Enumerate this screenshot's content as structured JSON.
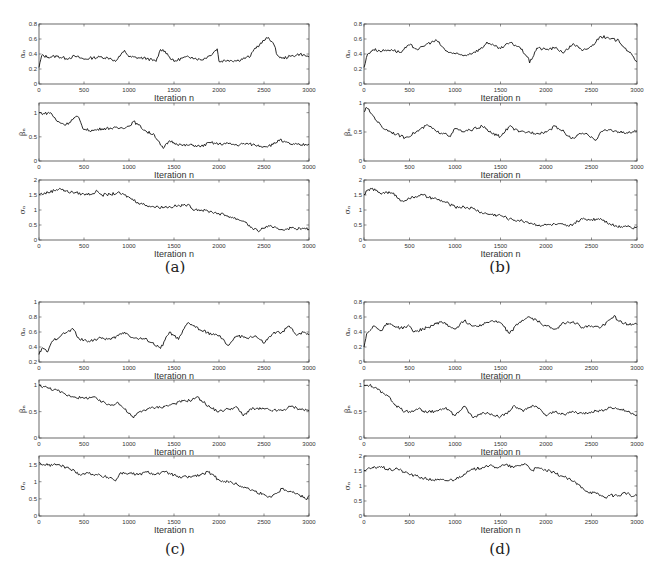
{
  "figure": {
    "panels": [
      {
        "id": "a",
        "caption": "(a)"
      },
      {
        "id": "b",
        "caption": "(b)"
      },
      {
        "id": "c",
        "caption": "(c)"
      },
      {
        "id": "d",
        "caption": "(d)"
      }
    ]
  },
  "chart_data": [
    {
      "panel": "a",
      "subplot": 1,
      "type": "line",
      "xlabel": "Iteration n",
      "ylabel": "α_n",
      "xlim": [
        0,
        3000
      ],
      "ylim": [
        0,
        0.8
      ],
      "xticks": [
        0,
        500,
        1000,
        1500,
        2000,
        2500,
        3000
      ],
      "yticks": [
        0,
        0.2,
        0.4,
        0.6,
        0.8
      ],
      "x": [
        0,
        30,
        100,
        200,
        300,
        400,
        500,
        600,
        700,
        800,
        850,
        900,
        950,
        1000,
        1100,
        1200,
        1300,
        1350,
        1400,
        1450,
        1500,
        1600,
        1700,
        1800,
        1900,
        1980,
        2000,
        2100,
        2200,
        2300,
        2350,
        2400,
        2450,
        2500,
        2550,
        2600,
        2650,
        2700,
        2800,
        2900,
        3000
      ],
      "values": [
        0.22,
        0.38,
        0.36,
        0.37,
        0.34,
        0.37,
        0.33,
        0.35,
        0.36,
        0.34,
        0.3,
        0.37,
        0.45,
        0.36,
        0.35,
        0.34,
        0.3,
        0.46,
        0.44,
        0.36,
        0.3,
        0.35,
        0.36,
        0.32,
        0.38,
        0.47,
        0.3,
        0.32,
        0.31,
        0.35,
        0.37,
        0.48,
        0.52,
        0.58,
        0.62,
        0.55,
        0.38,
        0.34,
        0.37,
        0.4,
        0.36
      ]
    },
    {
      "panel": "a",
      "subplot": 2,
      "type": "line",
      "xlabel": "Iteration n",
      "ylabel": "β_n",
      "xlim": [
        0,
        3000
      ],
      "ylim": [
        0,
        1.2
      ],
      "xticks": [
        0,
        500,
        1000,
        1500,
        2000,
        2500,
        3000
      ],
      "yticks": [
        0,
        0.5,
        1
      ],
      "x": [
        0,
        50,
        130,
        200,
        300,
        400,
        430,
        500,
        600,
        700,
        800,
        900,
        1000,
        1050,
        1100,
        1200,
        1280,
        1350,
        1380,
        1450,
        1500,
        1600,
        1700,
        1800,
        1900,
        2000,
        2100,
        2200,
        2300,
        2400,
        2500,
        2600,
        2680,
        2700,
        2800,
        2900,
        3000
      ],
      "values": [
        1.0,
        0.98,
        1.0,
        0.82,
        0.75,
        0.9,
        0.92,
        0.65,
        0.63,
        0.67,
        0.68,
        0.68,
        0.72,
        0.82,
        0.75,
        0.6,
        0.55,
        0.33,
        0.26,
        0.42,
        0.38,
        0.32,
        0.33,
        0.3,
        0.38,
        0.35,
        0.36,
        0.33,
        0.36,
        0.33,
        0.3,
        0.34,
        0.45,
        0.4,
        0.35,
        0.33,
        0.35
      ]
    },
    {
      "panel": "a",
      "subplot": 3,
      "type": "line",
      "xlabel": "Iteration n",
      "ylabel": "σ_n",
      "xlim": [
        0,
        3000
      ],
      "ylim": [
        0,
        2
      ],
      "xticks": [
        0,
        500,
        1000,
        1500,
        2000,
        2500,
        3000
      ],
      "yticks": [
        0,
        0.5,
        1,
        1.5,
        2
      ],
      "x": [
        0,
        100,
        230,
        300,
        400,
        500,
        600,
        650,
        700,
        800,
        870,
        950,
        1000,
        1100,
        1200,
        1300,
        1400,
        1500,
        1600,
        1650,
        1700,
        1800,
        1900,
        2000,
        2100,
        2200,
        2300,
        2350,
        2430,
        2500,
        2550,
        2600,
        2700,
        2800,
        2900,
        3000
      ],
      "values": [
        1.52,
        1.58,
        1.72,
        1.62,
        1.58,
        1.52,
        1.55,
        1.63,
        1.5,
        1.52,
        1.57,
        1.5,
        1.42,
        1.25,
        1.15,
        1.1,
        1.1,
        1.12,
        1.15,
        1.18,
        1.05,
        1.0,
        0.95,
        0.88,
        0.8,
        0.7,
        0.6,
        0.42,
        0.3,
        0.4,
        0.48,
        0.4,
        0.35,
        0.4,
        0.38,
        0.36
      ]
    },
    {
      "panel": "b",
      "subplot": 1,
      "type": "line",
      "xlabel": "Iteration n",
      "ylabel": "α_n",
      "xlim": [
        0,
        3000
      ],
      "ylim": [
        0,
        0.8
      ],
      "xticks": [
        0,
        500,
        1000,
        1500,
        2000,
        2500,
        3000
      ],
      "yticks": [
        0,
        0.2,
        0.4,
        0.6,
        0.8
      ],
      "x": [
        0,
        40,
        100,
        200,
        300,
        400,
        500,
        600,
        700,
        800,
        900,
        1000,
        1100,
        1200,
        1300,
        1350,
        1400,
        1500,
        1600,
        1700,
        1800,
        1820,
        1900,
        2000,
        2100,
        2200,
        2300,
        2400,
        2500,
        2600,
        2700,
        2800,
        2900,
        3000
      ],
      "values": [
        0.22,
        0.4,
        0.46,
        0.44,
        0.46,
        0.42,
        0.52,
        0.46,
        0.54,
        0.58,
        0.44,
        0.4,
        0.38,
        0.42,
        0.48,
        0.56,
        0.52,
        0.47,
        0.55,
        0.5,
        0.36,
        0.28,
        0.48,
        0.46,
        0.48,
        0.42,
        0.54,
        0.44,
        0.5,
        0.64,
        0.6,
        0.58,
        0.44,
        0.3
      ]
    },
    {
      "panel": "b",
      "subplot": 2,
      "type": "line",
      "xlabel": "Iteration n",
      "ylabel": "β_n",
      "xlim": [
        0,
        3000
      ],
      "ylim": [
        0,
        1
      ],
      "xticks": [
        0,
        500,
        1000,
        1500,
        2000,
        2500,
        3000
      ],
      "yticks": [
        0,
        0.5,
        1
      ],
      "x": [
        0,
        30,
        100,
        200,
        300,
        450,
        550,
        700,
        800,
        900,
        950,
        1000,
        1100,
        1200,
        1300,
        1400,
        1500,
        1600,
        1700,
        1800,
        1900,
        2000,
        2100,
        2200,
        2280,
        2400,
        2500,
        2550,
        2600,
        2700,
        2800,
        2900,
        3000
      ],
      "values": [
        0.85,
        0.92,
        0.78,
        0.58,
        0.5,
        0.4,
        0.48,
        0.62,
        0.5,
        0.48,
        0.42,
        0.56,
        0.5,
        0.55,
        0.6,
        0.48,
        0.42,
        0.6,
        0.5,
        0.5,
        0.48,
        0.5,
        0.6,
        0.5,
        0.38,
        0.48,
        0.42,
        0.36,
        0.5,
        0.54,
        0.5,
        0.48,
        0.52
      ]
    },
    {
      "panel": "b",
      "subplot": 3,
      "type": "line",
      "xlabel": "Iteration n",
      "ylabel": "σ_n",
      "xlim": [
        0,
        3000
      ],
      "ylim": [
        0,
        2
      ],
      "xticks": [
        0,
        500,
        1000,
        1500,
        2000,
        2500,
        3000
      ],
      "yticks": [
        0,
        0.5,
        1,
        1.5,
        2
      ],
      "x": [
        0,
        70,
        200,
        250,
        350,
        400,
        500,
        600,
        650,
        700,
        800,
        900,
        1000,
        1100,
        1200,
        1300,
        1400,
        1500,
        1600,
        1700,
        1800,
        1900,
        2000,
        2100,
        2200,
        2250,
        2350,
        2400,
        2500,
        2600,
        2700,
        2780,
        2900,
        2950,
        3000
      ],
      "values": [
        1.52,
        1.72,
        1.55,
        1.6,
        1.5,
        1.3,
        1.38,
        1.48,
        1.5,
        1.42,
        1.36,
        1.25,
        1.1,
        1.1,
        1.05,
        0.9,
        0.85,
        0.82,
        0.7,
        0.65,
        0.6,
        0.5,
        0.5,
        0.52,
        0.5,
        0.45,
        0.62,
        0.7,
        0.68,
        0.72,
        0.55,
        0.45,
        0.48,
        0.38,
        0.45
      ]
    },
    {
      "panel": "c",
      "subplot": 1,
      "type": "line",
      "xlabel": "Iteration n",
      "ylabel": "α_n",
      "xlim": [
        0,
        3000
      ],
      "ylim": [
        0.2,
        1
      ],
      "xticks": [
        0,
        500,
        1000,
        1500,
        2000,
        2500,
        3000
      ],
      "yticks": [
        0.2,
        0.4,
        0.6,
        0.8,
        1
      ],
      "x": [
        0,
        30,
        100,
        150,
        250,
        380,
        450,
        550,
        700,
        800,
        950,
        1050,
        1200,
        1350,
        1450,
        1500,
        1550,
        1650,
        1700,
        1800,
        1950,
        2000,
        2100,
        2200,
        2300,
        2400,
        2500,
        2600,
        2700,
        2780,
        2850,
        2950,
        3000
      ],
      "values": [
        0.3,
        0.38,
        0.34,
        0.48,
        0.56,
        0.64,
        0.5,
        0.48,
        0.52,
        0.5,
        0.6,
        0.52,
        0.5,
        0.38,
        0.6,
        0.55,
        0.5,
        0.72,
        0.7,
        0.62,
        0.56,
        0.55,
        0.42,
        0.55,
        0.52,
        0.55,
        0.45,
        0.58,
        0.6,
        0.68,
        0.57,
        0.6,
        0.56
      ]
    },
    {
      "panel": "c",
      "subplot": 2,
      "type": "line",
      "xlabel": "Iteration n",
      "ylabel": "β_n",
      "xlim": [
        0,
        3000
      ],
      "ylim": [
        0,
        1.1
      ],
      "xticks": [
        0,
        500,
        1000,
        1500,
        2000,
        2500,
        3000
      ],
      "yticks": [
        0,
        0.5,
        1
      ],
      "x": [
        0,
        100,
        200,
        300,
        400,
        500,
        600,
        700,
        800,
        870,
        950,
        1050,
        1100,
        1200,
        1300,
        1400,
        1500,
        1600,
        1700,
        1750,
        1800,
        1900,
        2000,
        2100,
        2200,
        2270,
        2350,
        2500,
        2600,
        2700,
        2800,
        2900,
        3000
      ],
      "values": [
        1.0,
        0.95,
        0.9,
        0.82,
        0.78,
        0.75,
        0.78,
        0.68,
        0.62,
        0.68,
        0.55,
        0.38,
        0.48,
        0.55,
        0.58,
        0.6,
        0.65,
        0.7,
        0.72,
        0.78,
        0.72,
        0.58,
        0.5,
        0.55,
        0.58,
        0.42,
        0.55,
        0.55,
        0.52,
        0.52,
        0.6,
        0.55,
        0.52
      ]
    },
    {
      "panel": "c",
      "subplot": 3,
      "type": "line",
      "xlabel": "Iteration n",
      "ylabel": "σ_n",
      "xlim": [
        0,
        3000
      ],
      "ylim": [
        0,
        1.75
      ],
      "xticks": [
        0,
        500,
        1000,
        1500,
        2000,
        2500,
        3000
      ],
      "yticks": [
        0,
        0.5,
        1,
        1.5
      ],
      "x": [
        0,
        50,
        100,
        200,
        300,
        400,
        450,
        550,
        650,
        700,
        800,
        850,
        900,
        1000,
        1100,
        1200,
        1300,
        1400,
        1500,
        1550,
        1700,
        1800,
        1880,
        1950,
        2000,
        2100,
        2200,
        2300,
        2400,
        2500,
        2550,
        2650,
        2700,
        2800,
        2900,
        2980,
        3000
      ],
      "values": [
        1.55,
        1.5,
        1.48,
        1.5,
        1.42,
        1.3,
        1.22,
        1.25,
        1.2,
        1.15,
        1.12,
        1.02,
        1.25,
        1.25,
        1.2,
        1.28,
        1.22,
        1.28,
        1.2,
        1.12,
        1.15,
        1.2,
        1.28,
        1.15,
        1.05,
        1.0,
        0.92,
        0.82,
        0.72,
        0.62,
        0.55,
        0.68,
        0.8,
        0.72,
        0.6,
        0.5,
        0.6
      ]
    },
    {
      "panel": "d",
      "subplot": 1,
      "type": "line",
      "xlabel": "Iteration n",
      "ylabel": "α_n",
      "xlim": [
        0,
        3000
      ],
      "ylim": [
        0,
        0.8
      ],
      "xticks": [
        0,
        500,
        1000,
        1500,
        2000,
        2500,
        3000
      ],
      "yticks": [
        0,
        0.2,
        0.4,
        0.6,
        0.8
      ],
      "x": [
        0,
        30,
        100,
        200,
        250,
        400,
        500,
        550,
        700,
        850,
        900,
        1000,
        1100,
        1200,
        1300,
        1400,
        1500,
        1600,
        1700,
        1800,
        1900,
        2000,
        2100,
        2200,
        2300,
        2400,
        2500,
        2600,
        2700,
        2750,
        2800,
        2900,
        3000
      ],
      "values": [
        0.2,
        0.38,
        0.48,
        0.42,
        0.52,
        0.45,
        0.48,
        0.4,
        0.46,
        0.54,
        0.5,
        0.44,
        0.55,
        0.48,
        0.5,
        0.55,
        0.52,
        0.38,
        0.52,
        0.6,
        0.55,
        0.48,
        0.44,
        0.52,
        0.54,
        0.46,
        0.48,
        0.46,
        0.56,
        0.62,
        0.54,
        0.5,
        0.5
      ]
    },
    {
      "panel": "d",
      "subplot": 2,
      "type": "line",
      "xlabel": "Iteration n",
      "ylabel": "β_n",
      "xlim": [
        0,
        3000
      ],
      "ylim": [
        0,
        1.1
      ],
      "xticks": [
        0,
        500,
        1000,
        1500,
        2000,
        2500,
        3000
      ],
      "yticks": [
        0,
        0.5,
        1
      ],
      "x": [
        0,
        60,
        150,
        250,
        350,
        450,
        500,
        600,
        700,
        800,
        900,
        1000,
        1100,
        1200,
        1300,
        1400,
        1500,
        1600,
        1650,
        1750,
        1850,
        1950,
        2000,
        2100,
        2200,
        2300,
        2400,
        2500,
        2600,
        2700,
        2800,
        2900,
        3000
      ],
      "values": [
        1.0,
        1.0,
        0.92,
        0.82,
        0.62,
        0.5,
        0.5,
        0.56,
        0.48,
        0.52,
        0.58,
        0.42,
        0.6,
        0.38,
        0.48,
        0.46,
        0.4,
        0.5,
        0.62,
        0.5,
        0.62,
        0.52,
        0.42,
        0.5,
        0.45,
        0.5,
        0.46,
        0.5,
        0.52,
        0.58,
        0.55,
        0.5,
        0.44
      ]
    },
    {
      "panel": "d",
      "subplot": 3,
      "type": "line",
      "xlabel": "Iteration n",
      "ylabel": "σ_n",
      "xlim": [
        0,
        3000
      ],
      "ylim": [
        0,
        2
      ],
      "xticks": [
        0,
        500,
        1000,
        1500,
        2000,
        2500,
        3000
      ],
      "yticks": [
        0,
        0.5,
        1,
        1.5,
        2
      ],
      "x": [
        0,
        100,
        170,
        300,
        350,
        450,
        550,
        700,
        800,
        900,
        1000,
        1100,
        1200,
        1300,
        1350,
        1450,
        1550,
        1650,
        1770,
        1850,
        1900,
        2000,
        2100,
        2200,
        2300,
        2400,
        2450,
        2550,
        2650,
        2700,
        2800,
        2870,
        2950,
        3000
      ],
      "values": [
        1.52,
        1.6,
        1.65,
        1.52,
        1.6,
        1.45,
        1.35,
        1.22,
        1.2,
        1.18,
        1.22,
        1.4,
        1.55,
        1.62,
        1.68,
        1.62,
        1.7,
        1.62,
        1.75,
        1.52,
        1.6,
        1.52,
        1.42,
        1.3,
        1.15,
        0.95,
        0.82,
        0.75,
        0.62,
        0.68,
        0.68,
        0.78,
        0.65,
        0.68
      ]
    }
  ]
}
